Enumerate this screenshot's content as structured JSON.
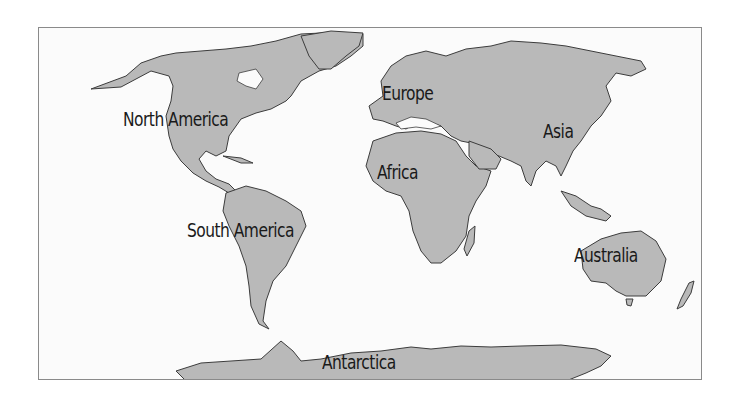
{
  "map": {
    "type": "world continents map",
    "colors": {
      "land": "#b9b9b9",
      "ocean": "#fbfbfb",
      "outline": "#3c3c3c",
      "frame": "#8a8a8a",
      "label": "#1a1a1a"
    },
    "labels": [
      {
        "id": "north-america",
        "text": "North America"
      },
      {
        "id": "europe",
        "text": "Europe"
      },
      {
        "id": "asia",
        "text": "Asia"
      },
      {
        "id": "africa",
        "text": "Africa"
      },
      {
        "id": "south-america",
        "text": "South America"
      },
      {
        "id": "australia",
        "text": "Australia"
      },
      {
        "id": "antarctica",
        "text": "Antarctica"
      }
    ]
  }
}
